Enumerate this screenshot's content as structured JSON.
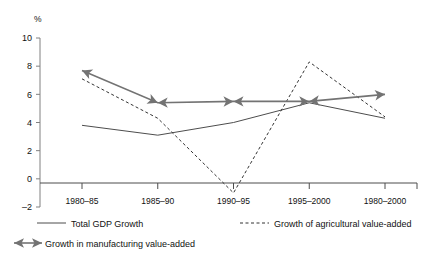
{
  "chart_data": {
    "type": "line",
    "title": "",
    "subtitle": "",
    "xlabel": "",
    "ylabel": "%",
    "ylim": [
      -2,
      10
    ],
    "yticks": [
      -2,
      0,
      2,
      4,
      6,
      8,
      10
    ],
    "ytick_labels": [
      "–2",
      "0",
      "2",
      "4",
      "6",
      "8",
      "10"
    ],
    "grid": false,
    "legend_position": "bottom",
    "categories": [
      "1980–85",
      "1985–90",
      "1990–95",
      "1995–2000",
      "1980–2000"
    ],
    "series": [
      {
        "name": "Total GDP Growth",
        "style": "solid",
        "color": "#4d4d4d",
        "values": [
          3.8,
          3.1,
          4.0,
          5.4,
          4.3
        ]
      },
      {
        "name": "Growth of agricultural value-added",
        "style": "dashed",
        "color": "#333333",
        "values": [
          7.1,
          4.3,
          -1.0,
          8.3,
          4.4
        ]
      },
      {
        "name": "Growth in manufacturing value-added",
        "style": "solid-arrow",
        "color": "#737373",
        "values": [
          7.7,
          5.4,
          5.5,
          5.5,
          6.0
        ]
      }
    ]
  },
  "axis": {
    "unit_label": "%"
  },
  "legend": {
    "items": [
      {
        "label": "Total GDP Growth",
        "marker": "solid-line-swatch"
      },
      {
        "label": "Growth of agricultural value-added",
        "marker": "dashed-line-swatch"
      },
      {
        "label": "Growth in manufacturing value-added",
        "marker": "double-arrow-swatch"
      }
    ]
  }
}
